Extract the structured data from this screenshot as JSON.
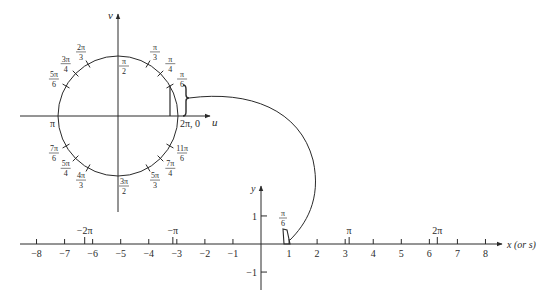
{
  "diagram": {
    "colors": {
      "line": "#2a2a2a",
      "background": "#ffffff"
    },
    "unit_circle": {
      "center": [
        118,
        116
      ],
      "radius": 60,
      "u_axis_label": "u",
      "v_axis_label": "v",
      "angle_labels": [
        {
          "id": "pi6",
          "num": "π",
          "den": "6",
          "deg": 30
        },
        {
          "id": "pi4",
          "num": "π",
          "den": "4",
          "deg": 45
        },
        {
          "id": "pi3",
          "num": "π",
          "den": "3",
          "deg": 60
        },
        {
          "id": "pi2",
          "num": "π",
          "den": "2",
          "deg": 90
        },
        {
          "id": "2pi3",
          "num": "2π",
          "den": "3",
          "deg": 120
        },
        {
          "id": "3pi4",
          "num": "3π",
          "den": "4",
          "deg": 135
        },
        {
          "id": "5pi6",
          "num": "5π",
          "den": "6",
          "deg": 150
        },
        {
          "id": "7pi6",
          "num": "7π",
          "den": "6",
          "deg": 210
        },
        {
          "id": "5pi4",
          "num": "5π",
          "den": "4",
          "deg": 225
        },
        {
          "id": "4pi3",
          "num": "4π",
          "den": "3",
          "deg": 240
        },
        {
          "id": "3pi2",
          "num": "3π",
          "den": "2",
          "deg": 270
        },
        {
          "id": "5pi3",
          "num": "5π",
          "den": "3",
          "deg": 300
        },
        {
          "id": "7pi4",
          "num": "7π",
          "den": "4",
          "deg": 315
        },
        {
          "id": "11pi6",
          "num": "11π",
          "den": "6",
          "deg": 330
        }
      ],
      "pi_label": "π",
      "zero_label": "2π, 0"
    },
    "number_line": {
      "origin": [
        261,
        244
      ],
      "unit_px": 28.06,
      "x_axis_label": "x (or s)",
      "y_axis_label": "y",
      "ticks": [
        -8,
        -7,
        -6,
        -5,
        -4,
        -3,
        -2,
        -1,
        1,
        2,
        3,
        4,
        5,
        6,
        7,
        8
      ],
      "tick_labels": [
        "−8",
        "−7",
        "−6",
        "−5",
        "−4",
        "−3",
        "−2",
        "−1",
        "1",
        "2",
        "3",
        "4",
        "5",
        "6",
        "7",
        "8"
      ],
      "y_ticks": [
        1,
        -1
      ],
      "y_tick_labels": [
        "1",
        "−1"
      ],
      "pi_marks": [
        {
          "value": -6.2832,
          "label": "−2π"
        },
        {
          "value": -3.1416,
          "label": "−π"
        },
        {
          "value": 3.1416,
          "label": "π"
        },
        {
          "value": 6.2832,
          "label": "2π"
        }
      ],
      "arc_label": {
        "num": "π",
        "den": "6"
      }
    }
  }
}
